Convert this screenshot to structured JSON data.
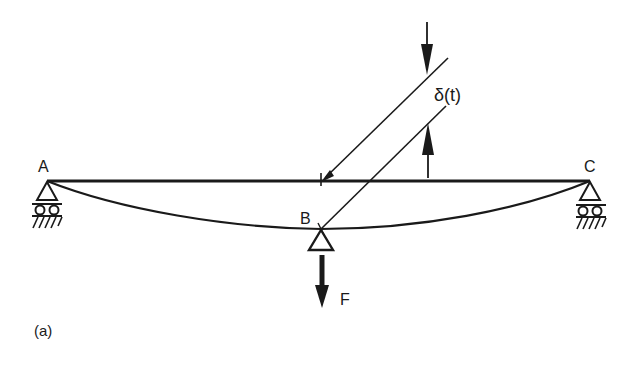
{
  "figure": {
    "caption": "(a)",
    "labels": {
      "point_a": "A",
      "point_b": "B",
      "point_c": "C",
      "force": "F",
      "deflection": "δ(t)"
    },
    "elements": {
      "beam": "straight undeformed beam A–C",
      "deflected_shape": "curved deflected beam sagging to B",
      "supports": [
        "roller support at A",
        "roller support at C",
        "support at B"
      ],
      "load": "downward force F at B",
      "dimension": "deflection δ(t) between undeformed beam and B"
    },
    "colors": {
      "ink": "#1a1a1a",
      "background": "#ffffff"
    }
  }
}
